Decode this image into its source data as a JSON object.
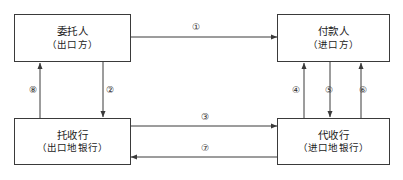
{
  "diagram": {
    "type": "flow-diagram",
    "title": "",
    "nodes": [
      {
        "id": "principal",
        "name": "委托人",
        "subtitle": "（出口方）",
        "position": "top-left"
      },
      {
        "id": "payer",
        "name": "付款人",
        "subtitle": "（进口方）",
        "position": "top-right"
      },
      {
        "id": "remitting-bank",
        "name": "托收行",
        "subtitle": "（出口地银行）",
        "position": "bottom-left"
      },
      {
        "id": "collecting-bank",
        "name": "代收行",
        "subtitle": "（进口地银行）",
        "position": "bottom-right"
      }
    ],
    "edges": [
      {
        "label": "①",
        "from": "principal",
        "to": "payer",
        "direction": "bidirectional",
        "orientation": "horizontal"
      },
      {
        "label": "②",
        "from": "principal",
        "to": "remitting-bank",
        "direction": "down",
        "orientation": "vertical"
      },
      {
        "label": "③",
        "from": "remitting-bank",
        "to": "collecting-bank",
        "direction": "right",
        "orientation": "horizontal"
      },
      {
        "label": "④",
        "from": "collecting-bank",
        "to": "payer",
        "direction": "up",
        "orientation": "vertical"
      },
      {
        "label": "⑤",
        "from": "payer",
        "to": "collecting-bank",
        "direction": "down",
        "orientation": "vertical"
      },
      {
        "label": "⑥",
        "from": "collecting-bank",
        "to": "payer",
        "direction": "up",
        "orientation": "vertical"
      },
      {
        "label": "⑦",
        "from": "collecting-bank",
        "to": "remitting-bank",
        "direction": "left",
        "orientation": "horizontal"
      },
      {
        "label": "⑧",
        "from": "remitting-bank",
        "to": "principal",
        "direction": "up",
        "orientation": "vertical"
      }
    ],
    "colors": {
      "stroke": "#3a3a3a",
      "text": "#1c1c1c",
      "background": "#ffffff"
    }
  }
}
